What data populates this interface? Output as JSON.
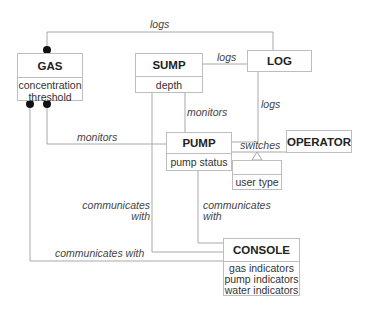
{
  "diagram": {
    "type": "class-association-diagram",
    "classes": {
      "gas": {
        "name": "GAS",
        "attributes": [
          "concentration",
          "threshold"
        ]
      },
      "sump": {
        "name": "SUMP",
        "attributes": [
          "depth"
        ]
      },
      "log": {
        "name": "LOG",
        "attributes": []
      },
      "pump": {
        "name": "PUMP",
        "attributes": [
          "pump status"
        ]
      },
      "operator": {
        "name": "OPERATOR",
        "attributes": []
      },
      "user_type": {
        "name": "",
        "attributes": [
          "user type"
        ]
      },
      "console": {
        "name": "CONSOLE",
        "attributes": [
          "gas indicators",
          "pump indicators",
          "water indicators"
        ]
      }
    },
    "associations": {
      "gas_log": {
        "label": "logs"
      },
      "sump_log": {
        "label": "logs"
      },
      "pump_log": {
        "label": "logs"
      },
      "sump_pump": {
        "label": "monitors"
      },
      "gas_pump": {
        "label": "monitors"
      },
      "pump_operator": {
        "label": "switches"
      },
      "sump_console": {
        "label_line1": "communicates",
        "label_line2": "with"
      },
      "pump_console": {
        "label_line1": "communicates",
        "label_line2": "with"
      },
      "gas_console": {
        "label": "communicates with"
      }
    },
    "colors": {
      "line": "#a8a8a8",
      "border": "#bdbdbd",
      "dot": "#111111"
    }
  }
}
